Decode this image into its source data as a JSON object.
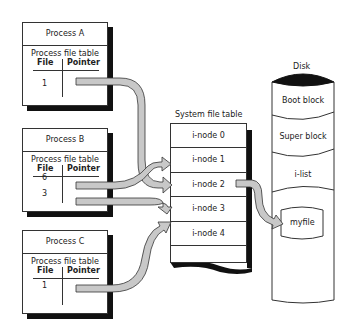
{
  "diagram": {
    "processes": [
      {
        "name": "Process A",
        "table_title": "Process file table",
        "col_file": "File",
        "col_pointer": "Pointer",
        "files": [
          "1"
        ]
      },
      {
        "name": "Process B",
        "table_title": "Process file table",
        "col_file": "File",
        "col_pointer": "Pointer",
        "files": [
          "6",
          "3"
        ]
      },
      {
        "name": "Process C",
        "table_title": "Process file table",
        "col_file": "File",
        "col_pointer": "Pointer",
        "files": [
          "1"
        ]
      }
    ],
    "system_file_table": {
      "title": "System file table",
      "rows": [
        "i-node 0",
        "i-node 1",
        "i-node 2",
        "i-node 3",
        "i-node 4",
        ""
      ]
    },
    "disk": {
      "title": "Disk",
      "sections": [
        "Boot block",
        "Super block",
        "i-list"
      ],
      "file": "myfile"
    },
    "arrows": [
      {
        "from": "Process A file 1",
        "to": "i-node 2"
      },
      {
        "from": "Process B file 6",
        "to": "i-node 1"
      },
      {
        "from": "Process B file 3",
        "to": "i-node 3"
      },
      {
        "from": "Process C file 1",
        "to": "i-node 3"
      },
      {
        "from": "i-node 2",
        "to": "myfile"
      }
    ],
    "colors": {
      "arrow_fill": "#c8c8c8",
      "outline": "#333333",
      "shadow": "#111111"
    }
  }
}
